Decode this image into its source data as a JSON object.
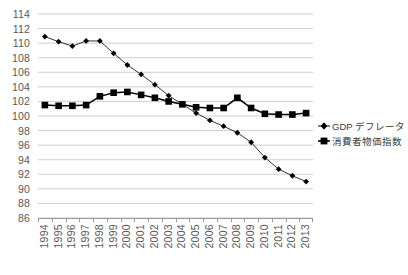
{
  "chart_data": {
    "type": "line",
    "title": "",
    "subtitle": "",
    "xlabel": "",
    "ylabel": "",
    "ylim": [
      86,
      114
    ],
    "ytick_step": 2,
    "grid": true,
    "legend_position": "right",
    "ytick_labels": [
      "114",
      "112",
      "110",
      "108",
      "106",
      "104",
      "102",
      "100",
      "98",
      "96",
      "94",
      "92",
      "90",
      "88",
      "86"
    ],
    "ytick_values": [
      114,
      112,
      110,
      108,
      106,
      104,
      102,
      100,
      98,
      96,
      94,
      92,
      90,
      88,
      86
    ],
    "categories": [
      "1994",
      "1995",
      "1996",
      "1997",
      "1998",
      "1999",
      "2000",
      "2001",
      "2002",
      "2003",
      "2004",
      "2005",
      "2006",
      "2007",
      "2008",
      "2009",
      "2010",
      "2011",
      "2012",
      "2013"
    ],
    "x": [
      1994,
      1995,
      1996,
      1997,
      1998,
      1999,
      2000,
      2001,
      2002,
      2003,
      2004,
      2005,
      2006,
      2007,
      2008,
      2009,
      2010,
      2011,
      2012,
      2013
    ],
    "series": [
      {
        "name": "GDP デフレータ",
        "marker": "diamond",
        "color": "#000000",
        "values": [
          110.9,
          110.2,
          109.6,
          110.3,
          110.3,
          108.6,
          107.0,
          105.7,
          104.3,
          102.8,
          101.6,
          100.4,
          99.4,
          98.6,
          97.7,
          96.4,
          94.3,
          92.7,
          91.8,
          91.0
        ]
      },
      {
        "name": "消費者物価指数",
        "marker": "square",
        "color": "#000000",
        "values": [
          101.5,
          101.4,
          101.4,
          101.5,
          102.7,
          103.2,
          103.3,
          102.9,
          102.5,
          102.0,
          101.6,
          101.2,
          101.1,
          101.1,
          102.5,
          101.1,
          100.3,
          100.2,
          100.2,
          100.4
        ]
      }
    ]
  },
  "legend": {
    "items": [
      {
        "label": "GDP デフレータ",
        "marker": "diamond"
      },
      {
        "label": "消費者物価指数",
        "marker": "square"
      }
    ]
  }
}
